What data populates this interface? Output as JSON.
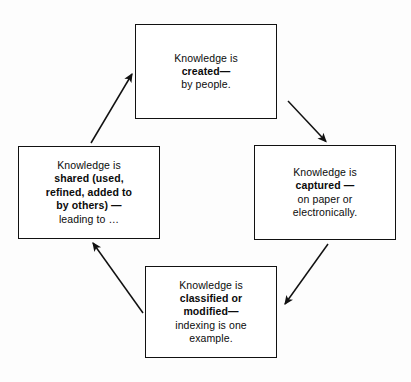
{
  "diagram": {
    "type": "cycle-flowchart",
    "colors": {
      "background": "#fdfdfd",
      "box_fill": "#ffffff",
      "box_border": "#111111",
      "arrow": "#111111",
      "text": "#0b0b0b"
    },
    "nodes": [
      {
        "id": "created",
        "position": "top",
        "lines": [
          {
            "text": "Knowledge is",
            "bold": false
          },
          {
            "text": "created—",
            "bold": true
          },
          {
            "text": "by  people.",
            "bold": false
          }
        ]
      },
      {
        "id": "captured",
        "position": "right",
        "lines": [
          {
            "text": "Knowledge is",
            "bold": false
          },
          {
            "text": "captured —",
            "bold": true
          },
          {
            "text": "on paper or",
            "bold": false
          },
          {
            "text": "electronically.",
            "bold": false
          }
        ]
      },
      {
        "id": "classified",
        "position": "bottom",
        "lines": [
          {
            "text": "Knowledge is",
            "bold": false
          },
          {
            "text": "classified or",
            "bold": true
          },
          {
            "text": "modified—",
            "bold": true
          },
          {
            "text": "indexing is one",
            "bold": false
          },
          {
            "text": "example.",
            "bold": false
          }
        ]
      },
      {
        "id": "shared",
        "position": "left",
        "lines": [
          {
            "text": "Knowledge is",
            "bold": false
          },
          {
            "text": "shared (used,",
            "bold": true
          },
          {
            "text": "refined, added to",
            "bold": true
          },
          {
            "text": "by others) —",
            "bold": true
          },
          {
            "text": "leading to …",
            "bold": false
          }
        ]
      }
    ],
    "arrows": [
      {
        "id": "created-to-captured",
        "from": "created",
        "to": "captured",
        "direction": "down-right"
      },
      {
        "id": "captured-to-classified",
        "from": "captured",
        "to": "classified",
        "direction": "down-left"
      },
      {
        "id": "classified-to-shared",
        "from": "classified",
        "to": "shared",
        "direction": "up-left"
      },
      {
        "id": "shared-to-created",
        "from": "shared",
        "to": "created",
        "direction": "up-right"
      }
    ]
  }
}
